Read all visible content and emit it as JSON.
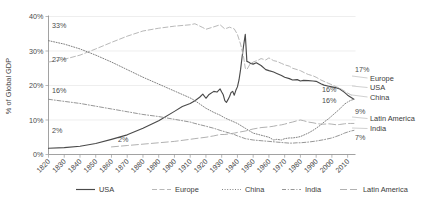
{
  "chart_data": {
    "type": "line",
    "title": "",
    "xlabel": "",
    "ylabel": "% of Global GDP",
    "xlim": [
      1820,
      2015
    ],
    "ylim": [
      0,
      40
    ],
    "grid": true,
    "legend_position": "bottom",
    "y_ticks": [
      "0%",
      "10%",
      "20%",
      "30%",
      "40%"
    ],
    "y_tick_values": [
      0,
      10,
      20,
      30,
      40
    ],
    "x_ticks": [
      "1820",
      "1830",
      "1840",
      "1850",
      "1860",
      "1870",
      "1880",
      "1890",
      "1900",
      "1910",
      "1920",
      "1930",
      "1940",
      "1950",
      "1960",
      "1970",
      "1980",
      "1990",
      "2000",
      "2010"
    ],
    "x_tick_values": [
      1820,
      1830,
      1840,
      1850,
      1860,
      1870,
      1880,
      1890,
      1900,
      1910,
      1920,
      1930,
      1940,
      1950,
      1960,
      1970,
      1980,
      1990,
      2000,
      2010
    ],
    "series": [
      {
        "name": "USA",
        "style": "solid",
        "color": "#4a4a4a",
        "x": [
          1820,
          1830,
          1840,
          1850,
          1860,
          1870,
          1880,
          1890,
          1900,
          1905,
          1910,
          1913,
          1916,
          1918,
          1920,
          1922,
          1925,
          1927,
          1929,
          1930,
          1931,
          1932,
          1933,
          1934,
          1935,
          1936,
          1937,
          1938,
          1939,
          1940,
          1941,
          1942,
          1943,
          1944,
          1945,
          1946,
          1947,
          1948,
          1950,
          1952,
          1955,
          1958,
          1960,
          1963,
          1965,
          1968,
          1970,
          1973,
          1975,
          1978,
          1980,
          1982,
          1985,
          1988,
          1990,
          1993,
          1995,
          1998,
          2000,
          2003,
          2005,
          2008,
          2010,
          2012,
          2014
        ],
        "y": [
          1.8,
          2.0,
          2.4,
          3.2,
          4.4,
          5.7,
          7.6,
          9.8,
          12.5,
          13.9,
          14.8,
          15.6,
          16.6,
          17.5,
          16.3,
          17.4,
          18.3,
          18.1,
          19.0,
          18.1,
          17.3,
          15.6,
          15.1,
          15.9,
          16.8,
          18.0,
          18.3,
          17.2,
          18.6,
          19.6,
          21.6,
          24.6,
          28.4,
          31.8,
          34.8,
          27.0,
          26.8,
          26.5,
          26.2,
          26.6,
          25.8,
          24.6,
          24.3,
          23.9,
          23.5,
          22.9,
          22.4,
          22.0,
          21.6,
          21.7,
          21.3,
          21.5,
          21.4,
          21.3,
          21.2,
          20.5,
          20.1,
          19.8,
          19.6,
          19.3,
          19.0,
          18.0,
          17.2,
          16.6,
          16.0
        ]
      },
      {
        "name": "Europe",
        "style": "dashed",
        "color": "#b4b4b4",
        "x": [
          1820,
          1830,
          1840,
          1850,
          1860,
          1870,
          1880,
          1890,
          1900,
          1910,
          1913,
          1918,
          1920,
          1925,
          1929,
          1932,
          1935,
          1938,
          1940,
          1942,
          1944,
          1945,
          1946,
          1948,
          1950,
          1953,
          1955,
          1958,
          1960,
          1963,
          1965,
          1968,
          1970,
          1973,
          1975,
          1978,
          1980,
          1983,
          1985,
          1988,
          1990,
          1993,
          1995,
          1998,
          2000,
          2003,
          2005,
          2008,
          2010,
          2012,
          2014
        ],
        "y": [
          26.8,
          27.6,
          28.8,
          30.6,
          32.5,
          34.3,
          35.8,
          36.6,
          37.2,
          37.6,
          37.9,
          36.8,
          36.3,
          37.0,
          37.6,
          36.4,
          36.9,
          36.4,
          34.8,
          32.0,
          28.0,
          25.0,
          24.6,
          26.2,
          26.8,
          27.3,
          27.8,
          27.4,
          28.0,
          27.2,
          27.0,
          26.4,
          26.0,
          25.6,
          25.0,
          24.6,
          24.3,
          23.6,
          23.2,
          22.8,
          22.4,
          21.6,
          21.2,
          20.6,
          20.2,
          19.6,
          19.2,
          18.4,
          17.8,
          17.3,
          17.0
        ]
      },
      {
        "name": "China",
        "style": "dotted",
        "color": "#7a7a7a",
        "x": [
          1820,
          1830,
          1840,
          1850,
          1860,
          1870,
          1880,
          1890,
          1900,
          1910,
          1913,
          1920,
          1925,
          1929,
          1932,
          1935,
          1938,
          1940,
          1945,
          1950,
          1955,
          1960,
          1963,
          1965,
          1968,
          1970,
          1973,
          1975,
          1978,
          1980,
          1982,
          1985,
          1988,
          1990,
          1993,
          1995,
          1998,
          2000,
          2003,
          2005,
          2008,
          2010,
          2012,
          2014
        ],
        "y": [
          33.0,
          32.0,
          30.6,
          28.8,
          26.8,
          24.6,
          22.4,
          20.4,
          18.4,
          16.4,
          15.6,
          13.4,
          12.2,
          11.4,
          10.6,
          10.0,
          9.4,
          9.0,
          7.6,
          6.2,
          5.6,
          5.0,
          4.2,
          4.4,
          4.2,
          4.6,
          4.8,
          4.8,
          5.0,
          5.2,
          5.6,
          6.2,
          7.0,
          7.6,
          8.6,
          9.4,
          10.4,
          11.2,
          12.4,
          13.2,
          14.6,
          15.2,
          15.7,
          16.0
        ]
      },
      {
        "name": "India",
        "style": "dashdot",
        "color": "#8a8a8a",
        "x": [
          1820,
          1830,
          1840,
          1850,
          1860,
          1870,
          1880,
          1890,
          1900,
          1910,
          1913,
          1920,
          1925,
          1929,
          1932,
          1935,
          1938,
          1940,
          1945,
          1950,
          1955,
          1960,
          1965,
          1970,
          1973,
          1975,
          1978,
          1980,
          1985,
          1990,
          1995,
          2000,
          2005,
          2008,
          2010,
          2012,
          2014
        ],
        "y": [
          16.0,
          15.4,
          14.8,
          14.0,
          13.2,
          12.4,
          11.6,
          11.0,
          10.2,
          9.4,
          9.0,
          8.2,
          7.6,
          7.0,
          6.6,
          6.2,
          5.8,
          5.4,
          4.6,
          4.2,
          4.0,
          3.8,
          3.6,
          3.4,
          3.3,
          3.3,
          3.4,
          3.4,
          3.6,
          3.9,
          4.3,
          4.8,
          5.6,
          6.2,
          6.5,
          6.8,
          7.0
        ]
      },
      {
        "name": "Latin America",
        "style": "longdash",
        "color": "#a8a8a8",
        "x": [
          1860,
          1870,
          1880,
          1890,
          1900,
          1910,
          1913,
          1920,
          1925,
          1929,
          1932,
          1935,
          1938,
          1940,
          1945,
          1950,
          1955,
          1960,
          1963,
          1965,
          1968,
          1970,
          1973,
          1975,
          1978,
          1980,
          1982,
          1985,
          1988,
          1990,
          1993,
          1995,
          1998,
          2000,
          2003,
          2005,
          2008,
          2010,
          2012,
          2014
        ],
        "y": [
          2.2,
          2.6,
          3.0,
          3.4,
          3.8,
          4.4,
          4.6,
          5.0,
          5.4,
          5.8,
          5.8,
          6.0,
          6.2,
          6.4,
          6.8,
          7.4,
          7.8,
          8.0,
          8.2,
          8.4,
          8.6,
          8.8,
          9.2,
          9.4,
          9.8,
          10.0,
          9.8,
          9.4,
          9.2,
          9.0,
          8.8,
          8.8,
          8.9,
          8.8,
          8.6,
          8.7,
          8.9,
          9.0,
          9.0,
          9.0
        ]
      }
    ],
    "annotations_left": [
      {
        "label": "33%",
        "series": "China",
        "value": 33
      },
      {
        "label": "27%",
        "series": "Europe",
        "value": 27
      },
      {
        "label": "16%",
        "series": "India",
        "value": 16
      },
      {
        "label": "2%",
        "series": "USA",
        "value": 2
      }
    ],
    "annotations_inner": [
      {
        "label": "2%",
        "series": "Latin America",
        "value": 2
      }
    ],
    "annotations_right": [
      {
        "value_label": "17%",
        "name": "Europe"
      },
      {
        "value_label": "16%",
        "name": "USA"
      },
      {
        "value_label": "16%",
        "name": "China"
      },
      {
        "value_label": "9%",
        "name": "Latin America"
      },
      {
        "value_label": "7%",
        "name": "India"
      }
    ]
  },
  "legend": {
    "items": [
      {
        "label": "USA",
        "style": "solid"
      },
      {
        "label": "Europe",
        "style": "dashed"
      },
      {
        "label": "China",
        "style": "dotted"
      },
      {
        "label": "India",
        "style": "dashdot"
      },
      {
        "label": "Latin America",
        "style": "longdash"
      }
    ]
  }
}
